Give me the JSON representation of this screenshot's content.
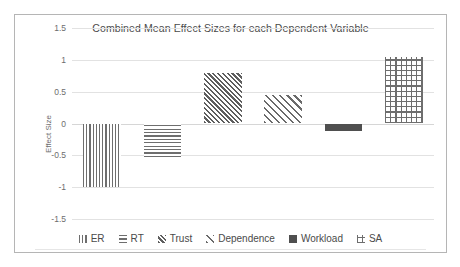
{
  "chart_data": {
    "type": "bar",
    "title": "Combined Mean Effect Sizes for each Dependent Variable",
    "xlabel": "",
    "ylabel": "Effect Size",
    "categories": [
      "ER",
      "RT",
      "Trust",
      "Dependence",
      "Workload",
      "SA"
    ],
    "values": [
      -0.99,
      -0.53,
      0.8,
      0.44,
      -0.12,
      1.05
    ],
    "ylim": [
      -1.5,
      1.5
    ],
    "yticks": [
      "1.5",
      "1",
      "0.5",
      "0",
      "-0.5",
      "-1",
      "-1.5"
    ],
    "ytick_values": [
      1.5,
      1,
      0.5,
      0,
      -0.5,
      -1,
      -1.5
    ],
    "grid": true,
    "legend_position": "bottom",
    "legend": [
      {
        "label": "ER",
        "pattern": "vertical-lines",
        "color": "#6e6e6e"
      },
      {
        "label": "RT",
        "pattern": "horizontal-lines",
        "color": "#6e6e6e"
      },
      {
        "label": "Trust",
        "pattern": "diagonal-dense",
        "color": "#5e5e5e"
      },
      {
        "label": "Dependence",
        "pattern": "diagonal-wide",
        "color": "#6a6a6a"
      },
      {
        "label": "Workload",
        "pattern": "solid",
        "color": "#4f4f4f"
      },
      {
        "label": "SA",
        "pattern": "crosshatch-grid",
        "color": "#6e6e6e"
      }
    ],
    "series": [
      {
        "name": "Combined Mean Effect Size",
        "points": [
          {
            "category": "ER",
            "value": -0.99,
            "pattern": "vertical-lines"
          },
          {
            "category": "RT",
            "value": -0.53,
            "pattern": "horizontal-lines"
          },
          {
            "category": "Trust",
            "value": 0.8,
            "pattern": "diagonal-dense"
          },
          {
            "category": "Dependence",
            "value": 0.44,
            "pattern": "diagonal-wide"
          },
          {
            "category": "Workload",
            "value": -0.12,
            "pattern": "solid"
          },
          {
            "category": "SA",
            "value": 1.05,
            "pattern": "crosshatch-grid"
          }
        ]
      }
    ],
    "colors": {
      "background": "#ffffff",
      "border": "#b5b5b5",
      "gridline": "#e2e2e2",
      "axis_text": "#6d6d6d",
      "title_text": "#4a4a4a"
    }
  }
}
